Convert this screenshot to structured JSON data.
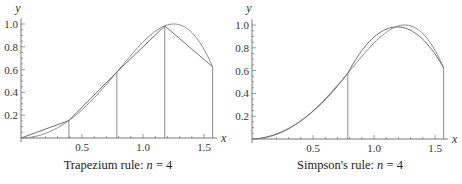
{
  "colors": {
    "axis": "#555555",
    "curve": "#8a8a8a",
    "approx": "#6f6f6f",
    "text": "#333333"
  },
  "chart_data": [
    {
      "type": "line",
      "title": "Trapezium rule: n = 4",
      "caption_prefix": "Trapezium rule: ",
      "caption_var": "n",
      "caption_suffix": " = 4",
      "function": "sin(x^2)",
      "xlabel": "x",
      "ylabel": "y",
      "xlim": [
        0,
        1.5708
      ],
      "ylim": [
        0,
        1.0
      ],
      "xticks": [
        0.5,
        1.0,
        1.5
      ],
      "xtick_labels": [
        "0.5",
        "1.0",
        "1.5"
      ],
      "yticks": [
        0.2,
        0.4,
        0.6,
        0.8,
        1.0
      ],
      "ytick_labels": [
        "0.2",
        "0.4",
        "0.6",
        "0.8",
        "1.0"
      ],
      "grid": false,
      "n": 4,
      "nodes_x": [
        0,
        0.3927,
        0.7854,
        1.1781,
        1.5708
      ],
      "nodes_y": [
        0,
        0.1535,
        0.5783,
        0.983,
        0.6243
      ],
      "approximation": "piecewise-linear",
      "vertical_lines_x": [
        0.3927,
        0.7854,
        1.1781,
        1.5708
      ]
    },
    {
      "type": "line",
      "title": "Simpson's rule: n = 4",
      "caption_prefix": "Simpson's rule: ",
      "caption_var": "n",
      "caption_suffix": " = 4",
      "function": "sin(x^2)",
      "xlabel": "x",
      "ylabel": "y",
      "xlim": [
        0,
        1.5708
      ],
      "ylim": [
        0,
        1.0
      ],
      "xticks": [
        0.5,
        1.0,
        1.5
      ],
      "xtick_labels": [
        "0.5",
        "1.0",
        "1.5"
      ],
      "yticks": [
        0.2,
        0.4,
        0.6,
        0.8,
        1.0
      ],
      "ytick_labels": [
        "0.2",
        "0.4",
        "0.6",
        "0.8",
        "1.0"
      ],
      "grid": false,
      "n": 4,
      "nodes_x": [
        0,
        0.3927,
        0.7854,
        1.1781,
        1.5708
      ],
      "nodes_y": [
        0,
        0.1535,
        0.5783,
        0.983,
        0.6243
      ],
      "approximation": "piecewise-quadratic",
      "vertical_lines_x": [
        0.7854,
        1.5708
      ]
    }
  ]
}
